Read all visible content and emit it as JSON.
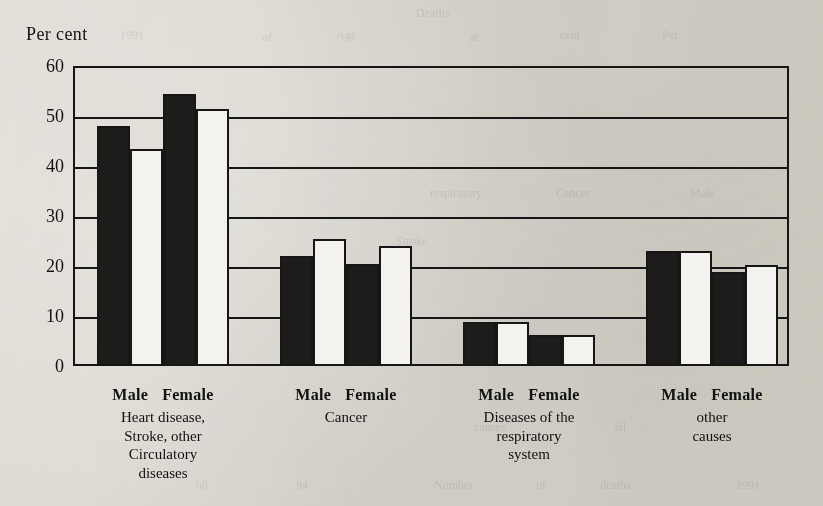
{
  "chart_data": {
    "type": "bar",
    "title": "",
    "subtitle": "",
    "xlabel": "",
    "ylabel": "Per cent",
    "ylim": [
      0,
      60
    ],
    "yticks": [
      0,
      10,
      20,
      30,
      40,
      50,
      60
    ],
    "grid": true,
    "legend": "none",
    "categories": [
      "Heart disease, Stroke, other Circulatory diseases",
      "Cancer",
      "Diseases of the respiratory system",
      "other causes"
    ],
    "group_sex_labels": [
      "Male",
      "Female"
    ],
    "series": [
      {
        "name": "Male bar 1",
        "values": [
          48,
          22,
          8.8,
          23
        ]
      },
      {
        "name": "Male bar 2",
        "values": [
          43.5,
          25.5,
          8.8,
          23
        ]
      },
      {
        "name": "Female bar 1",
        "values": [
          54.5,
          20.5,
          6.3,
          18.8
        ]
      },
      {
        "name": "Female bar 2",
        "values": [
          51.5,
          24,
          6.3,
          20.3
        ]
      }
    ],
    "bar_fill_pattern": [
      "dark",
      "light",
      "dark",
      "light"
    ],
    "colors": {
      "dark_bar": "#1d1c1a",
      "light_bar": "#f4f2ee",
      "outline": "#161616",
      "paper": "#e9e7e2"
    }
  },
  "axis": {
    "ylabel": "Per cent",
    "tick_labels": [
      "60",
      "50",
      "40",
      "30",
      "20",
      "10",
      "0"
    ]
  },
  "groups": [
    {
      "male_label": "Male",
      "female_label": "Female",
      "cause_lines": [
        "Heart disease,",
        "Stroke, other",
        "Circulatory",
        "diseases"
      ]
    },
    {
      "male_label": "Male",
      "female_label": "Female",
      "cause_lines": [
        "Cancer"
      ]
    },
    {
      "male_label": "Male",
      "female_label": "Female",
      "cause_lines": [
        "Diseases of the",
        "respiratory",
        "system"
      ]
    },
    {
      "male_label": "Male",
      "female_label": "Female",
      "cause_lines": [
        "other",
        "causes"
      ]
    }
  ],
  "bleed_through": [
    {
      "text": "Deaths",
      "left": 416,
      "top": 6
    },
    {
      "text": "1991",
      "left": 120,
      "top": 28
    },
    {
      "text": "of",
      "left": 262,
      "top": 30
    },
    {
      "text": "Age",
      "left": 336,
      "top": 28
    },
    {
      "text": "at",
      "left": 470,
      "top": 30
    },
    {
      "text": "cent",
      "left": 560,
      "top": 28
    },
    {
      "text": "Per",
      "left": 662,
      "top": 28
    },
    {
      "text": "respiratory",
      "left": 430,
      "top": 186
    },
    {
      "text": "Cancer",
      "left": 556,
      "top": 186
    },
    {
      "text": "Male",
      "left": 690,
      "top": 186
    },
    {
      "text": "Stroke",
      "left": 396,
      "top": 234
    },
    {
      "text": "60",
      "left": 196,
      "top": 478
    },
    {
      "text": "84",
      "left": 296,
      "top": 478
    },
    {
      "text": "Number",
      "left": 434,
      "top": 478
    },
    {
      "text": "of",
      "left": 536,
      "top": 478
    },
    {
      "text": "deaths",
      "left": 600,
      "top": 478
    },
    {
      "text": "1991",
      "left": 736,
      "top": 478
    },
    {
      "text": "causes",
      "left": 474,
      "top": 420
    },
    {
      "text": "all",
      "left": 614,
      "top": 420
    }
  ]
}
